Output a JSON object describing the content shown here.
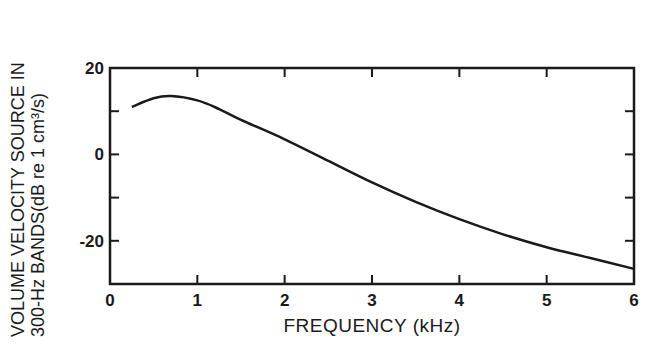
{
  "chart_data": {
    "type": "line",
    "title": "",
    "xlabel": "FREQUENCY  (kHz)",
    "ylabel_line1": "VOLUME VELOCITY SOURCE IN",
    "ylabel_line2": "300-Hz BANDS(dB re 1 cm³/s)",
    "xlim": [
      0,
      6
    ],
    "ylim": [
      -30,
      20
    ],
    "x_ticks": [
      "0",
      "1",
      "2",
      "3",
      "4",
      "5",
      "6"
    ],
    "y_ticks": [
      "20",
      "0",
      "-20"
    ],
    "grid": false,
    "legend": null,
    "series": [
      {
        "name": "Volume velocity source",
        "x": [
          0.25,
          0.5,
          0.7,
          1.0,
          1.25,
          1.5,
          2.0,
          2.5,
          3.0,
          3.5,
          4.0,
          4.5,
          5.0,
          5.5,
          6.0
        ],
        "y": [
          11,
          13,
          13.5,
          12.5,
          10.5,
          8,
          3.5,
          -1.5,
          -6.5,
          -11,
          -15,
          -18.5,
          -21.5,
          -24,
          -26.5
        ]
      }
    ]
  }
}
